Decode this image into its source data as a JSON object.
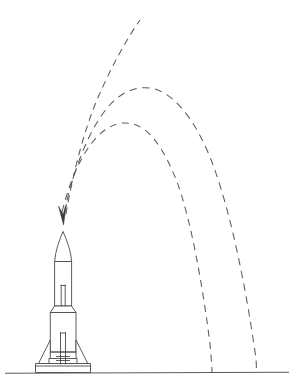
{
  "figure": {
    "kind": "line-drawing",
    "title": "",
    "background_color": "#ffffff",
    "line_color": "#4a4a4a",
    "dash_color": "#5b5b5b",
    "ground_color": "#5a5a5a",
    "canvas": {
      "width": 303,
      "height": 391
    }
  },
  "scene": {
    "ground": {
      "label": "ground-line",
      "x1": 5,
      "y1": 373,
      "x2": 289,
      "y2": 372
    },
    "arrow": {
      "label": "impact-arrow",
      "tip_x": 63,
      "tip_y": 224,
      "direction": "down"
    },
    "rocket": {
      "label": "multistage-rocket",
      "nose_tip_x": 63,
      "nose_tip_y": 231,
      "base_y": 371,
      "stages": 2,
      "fins": 2,
      "has_launch_pad": true
    },
    "trajectories": [
      {
        "name": "trajectory-outbound-steep",
        "style": "dashed",
        "start_x": 66,
        "start_y": 216,
        "end_x": 140,
        "end_y": 20,
        "lands": false
      },
      {
        "name": "trajectory-mid-arc",
        "style": "dashed",
        "start_x": 64,
        "start_y": 214,
        "apex_x": 150,
        "apex_y": 88,
        "end_x": 256,
        "end_y": 373,
        "lands": true
      },
      {
        "name": "trajectory-low-arc",
        "style": "dashed",
        "start_x": 63,
        "start_y": 213,
        "apex_x": 133,
        "apex_y": 124,
        "end_x": 212,
        "end_y": 373,
        "lands": true
      }
    ]
  }
}
